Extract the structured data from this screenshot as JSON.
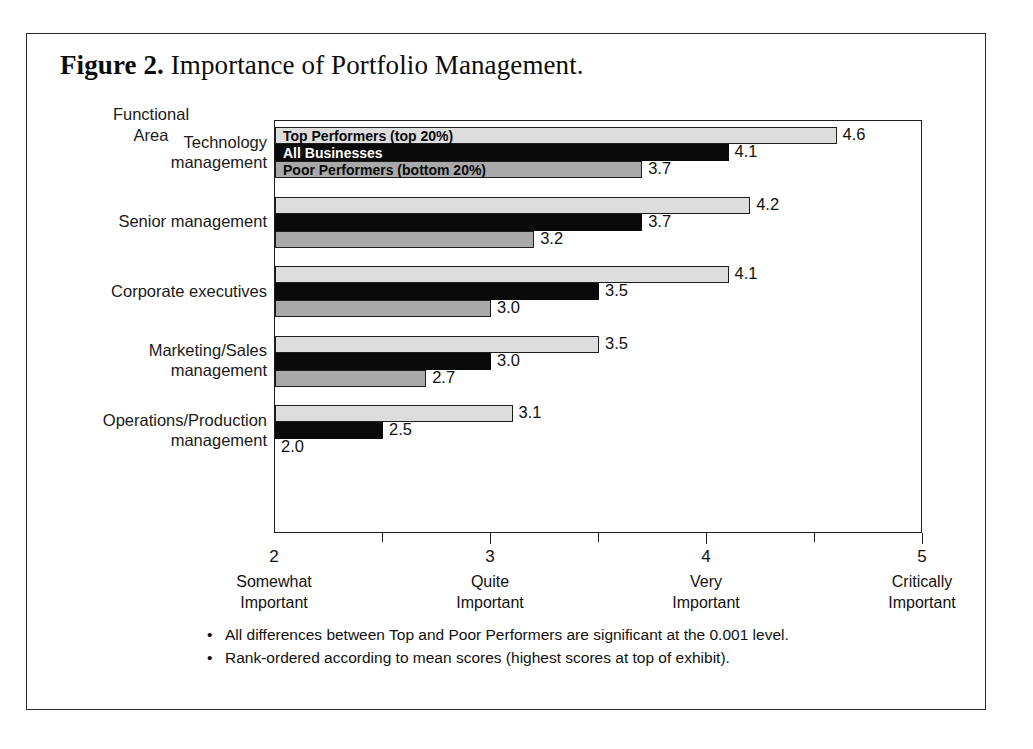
{
  "figure": {
    "number_label": "Figure 2.",
    "title": "Importance of Portfolio Management."
  },
  "axis_title": "Functional\nArea",
  "axis_title_line1": "Functional",
  "axis_title_line2": "Area",
  "legend": {
    "top": "Top Performers (top 20%)",
    "all": "All Businesses",
    "poor": "Poor Performers (bottom 20%)"
  },
  "colors": {
    "top_performers": "#dddddd",
    "all_businesses": "#0a0a0a",
    "poor_performers": "#a9a9a9",
    "outline": "#1d1d1d",
    "text": "#111111",
    "background": "#ffffff"
  },
  "footnotes": [
    "All differences between Top and Poor Performers are significant at the 0.001 level.",
    "Rank-ordered according to mean scores (highest scores at top of exhibit)."
  ],
  "bullet_glyph": "•",
  "chart_data": {
    "type": "bar",
    "orientation": "horizontal",
    "title": "Figure 2. Importance of Portfolio Management.",
    "xlabel": "",
    "ylabel": "Functional Area",
    "xlim": [
      2,
      5
    ],
    "grid": false,
    "legend_position": "inside-first-group",
    "categories": [
      "Technology management",
      "Senior management",
      "Corporate executives",
      "Marketing/Sales management",
      "Operations/Production management"
    ],
    "category_lines": [
      [
        "Technology",
        "management"
      ],
      [
        "Senior management"
      ],
      [
        "Corporate executives"
      ],
      [
        "Marketing/Sales",
        "management"
      ],
      [
        "Operations/Production",
        "management"
      ]
    ],
    "series": [
      {
        "name": "Top Performers (top 20%)",
        "color": "#dddddd",
        "values": [
          4.6,
          4.2,
          4.1,
          3.5,
          3.1
        ],
        "labels": [
          "4.6",
          "4.2",
          "4.1",
          "3.5",
          "3.1"
        ]
      },
      {
        "name": "All Businesses",
        "color": "#0a0a0a",
        "values": [
          4.1,
          3.7,
          3.5,
          3.0,
          2.5
        ],
        "labels": [
          "4.1",
          "3.7",
          "3.5",
          "3.0",
          "2.5"
        ]
      },
      {
        "name": "Poor Performers (bottom 20%)",
        "color": "#a9a9a9",
        "values": [
          3.7,
          3.2,
          3.0,
          2.7,
          2.0
        ],
        "labels": [
          "3.7",
          "3.2",
          "3.0",
          "2.7",
          "2.0"
        ]
      }
    ],
    "x_ticks_major": [
      2,
      3,
      4,
      5
    ],
    "x_ticks_minor": [
      2.5,
      3.5,
      4.5
    ],
    "x_tick_labels": [
      "2",
      "3",
      "4",
      "5"
    ],
    "x_tick_descriptions": [
      [
        "Somewhat",
        "Important"
      ],
      [
        "Quite",
        "Important"
      ],
      [
        "Very",
        "Important"
      ],
      [
        "Critically",
        "Important"
      ]
    ]
  }
}
